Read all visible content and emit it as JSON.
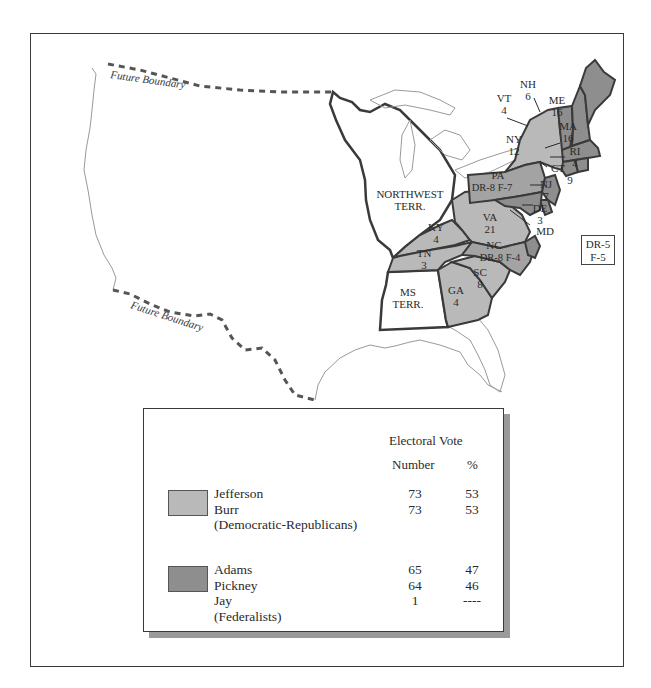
{
  "map": {
    "future_boundary_labels": [
      "Future Boundary",
      "Future Boundary"
    ],
    "colors": {
      "democratic_republican": "#b9b9b9",
      "federalist": "#8e8e8e",
      "territory": "#ffffff",
      "border": "#3a3a3a"
    },
    "regions": [
      {
        "abbr": "NORTHWEST",
        "line2": "TERR.",
        "party": "territory"
      },
      {
        "abbr": "MS",
        "line2": "TERR.",
        "party": "territory"
      },
      {
        "abbr": "NH",
        "votes": "6",
        "party": "federalist"
      },
      {
        "abbr": "VT",
        "votes": "4",
        "party": "federalist"
      },
      {
        "abbr": "ME",
        "votes": "16",
        "party": "federalist"
      },
      {
        "abbr": "MA",
        "votes": "16",
        "party": "federalist"
      },
      {
        "abbr": "RI",
        "votes": "4",
        "party": "federalist"
      },
      {
        "abbr": "CT",
        "votes": "9",
        "party": "federalist"
      },
      {
        "abbr": "NY",
        "votes": "12",
        "party": "democratic_republican"
      },
      {
        "abbr": "PA",
        "votes": "DR-8 F-7",
        "party": "split"
      },
      {
        "abbr": "NJ",
        "votes": "7",
        "party": "federalist"
      },
      {
        "abbr": "DE",
        "votes": "3",
        "party": "federalist"
      },
      {
        "abbr": "MD",
        "votes": "DR-5 F-5",
        "party": "split"
      },
      {
        "abbr": "VA",
        "votes": "21",
        "party": "democratic_republican"
      },
      {
        "abbr": "KY",
        "votes": "4",
        "party": "democratic_republican"
      },
      {
        "abbr": "NC",
        "votes": "DR-8 F-4",
        "party": "split"
      },
      {
        "abbr": "TN",
        "votes": "3",
        "party": "democratic_republican"
      },
      {
        "abbr": "SC",
        "votes": "8",
        "party": "democratic_republican"
      },
      {
        "abbr": "GA",
        "votes": "4",
        "party": "democratic_republican"
      }
    ],
    "md_split": {
      "line1": "DR-5",
      "line2": "F-5"
    }
  },
  "legend": {
    "header": "Electoral Vote",
    "col_number": "Number",
    "col_percent": "%",
    "groups": [
      {
        "party": "(Democratic-Republicans)",
        "color": "#b9b9b9",
        "candidates": [
          {
            "name": "Jefferson",
            "number": "73",
            "percent": "53"
          },
          {
            "name": "Burr",
            "number": "73",
            "percent": "53"
          }
        ]
      },
      {
        "party": "(Federalists)",
        "color": "#8e8e8e",
        "candidates": [
          {
            "name": "Adams",
            "number": "65",
            "percent": "47"
          },
          {
            "name": "Pickney",
            "number": "64",
            "percent": "46"
          },
          {
            "name": "Jay",
            "number": "1",
            "percent": "----"
          }
        ]
      }
    ]
  }
}
